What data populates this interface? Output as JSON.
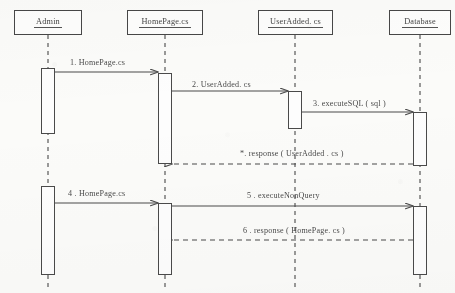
{
  "diagram": {
    "kind": "uml-sequence-diagram",
    "background_color": "#fbfbf9",
    "line_color": "#4a4a4a",
    "text_color": "#4a4a4a"
  },
  "lifelines": [
    {
      "id": "admin",
      "label": "Admin",
      "underlined": true,
      "box": {
        "x": 14,
        "y": 10,
        "w": 68,
        "h": 25
      },
      "axis_x": 48,
      "lifeline_bottom": 288
    },
    {
      "id": "homepage",
      "label": "HomePage.cs",
      "underlined": true,
      "box": {
        "x": 127,
        "y": 10,
        "w": 76,
        "h": 25
      },
      "axis_x": 165,
      "lifeline_bottom": 288
    },
    {
      "id": "useradded",
      "label": "UserAdded. cs",
      "underlined": true,
      "box": {
        "x": 258,
        "y": 10,
        "w": 75,
        "h": 25
      },
      "axis_x": 295,
      "lifeline_bottom": 288
    },
    {
      "id": "database",
      "label": "Database",
      "underlined": true,
      "box": {
        "x": 389,
        "y": 10,
        "w": 62,
        "h": 25
      },
      "axis_x": 420,
      "lifeline_bottom": 288
    }
  ],
  "activations": [
    {
      "id": "act-admin-1",
      "lifeline": "admin",
      "x": 41,
      "y": 68,
      "w": 14,
      "h": 66
    },
    {
      "id": "act-admin-2",
      "lifeline": "admin",
      "x": 41,
      "y": 186,
      "w": 14,
      "h": 89
    },
    {
      "id": "act-homepage-1",
      "lifeline": "homepage",
      "x": 158,
      "y": 73,
      "w": 14,
      "h": 91
    },
    {
      "id": "act-homepage-2",
      "lifeline": "homepage",
      "x": 158,
      "y": 203,
      "w": 14,
      "h": 72
    },
    {
      "id": "act-useradded-1",
      "lifeline": "useradded",
      "x": 288,
      "y": 91,
      "w": 14,
      "h": 38
    },
    {
      "id": "act-database-1",
      "lifeline": "database",
      "x": 413,
      "y": 112,
      "w": 14,
      "h": 54
    },
    {
      "id": "act-database-2",
      "lifeline": "database",
      "x": 413,
      "y": 206,
      "w": 14,
      "h": 69
    }
  ],
  "messages": [
    {
      "id": "m1",
      "number": "1.",
      "label": "1.  HomePage.cs",
      "from": "admin",
      "to": "homepage",
      "type": "call",
      "style": "solid",
      "direction": "right",
      "x1": 55,
      "x2": 158,
      "y": 72,
      "label_x": 70,
      "label_y": 58
    },
    {
      "id": "m2",
      "number": "2.",
      "label": "2.  UserAdded. cs",
      "from": "homepage",
      "to": "useradded",
      "type": "call",
      "style": "solid",
      "direction": "right",
      "x1": 172,
      "x2": 288,
      "y": 91,
      "label_x": 192,
      "label_y": 80
    },
    {
      "id": "m3",
      "number": "3.",
      "label": "3.  executeSQL ( sql )",
      "from": "useradded",
      "to": "database",
      "type": "call",
      "style": "solid",
      "direction": "right",
      "x1": 302,
      "x2": 413,
      "y": 112,
      "label_x": 313,
      "label_y": 99
    },
    {
      "id": "m4",
      "number": "*.",
      "label": "*.  response  ( UserAdded . cs )",
      "from": "database",
      "to": "homepage",
      "type": "return",
      "style": "dashed",
      "direction": "left",
      "x1": 413,
      "x2": 172,
      "y": 164,
      "label_x": 240,
      "label_y": 149
    },
    {
      "id": "m5",
      "number": "4 .",
      "label": "4 .  HomePage.cs",
      "from": "admin",
      "to": "homepage",
      "type": "call",
      "style": "solid",
      "direction": "right",
      "x1": 55,
      "x2": 158,
      "y": 203,
      "label_x": 68,
      "label_y": 189
    },
    {
      "id": "m6",
      "number": "5 .",
      "label": "5 .     executeNonQuery",
      "from": "homepage",
      "to": "database",
      "type": "call",
      "style": "solid",
      "direction": "right",
      "x1": 172,
      "x2": 413,
      "y": 206,
      "label_x": 247,
      "label_y": 191
    },
    {
      "id": "m7",
      "number": "6 .",
      "label": "6 .  response  ( HomePage. cs )",
      "from": "database",
      "to": "homepage",
      "type": "return",
      "style": "dashed",
      "direction": "left",
      "x1": 413,
      "x2": 172,
      "y": 240,
      "label_x": 243,
      "label_y": 226
    }
  ]
}
